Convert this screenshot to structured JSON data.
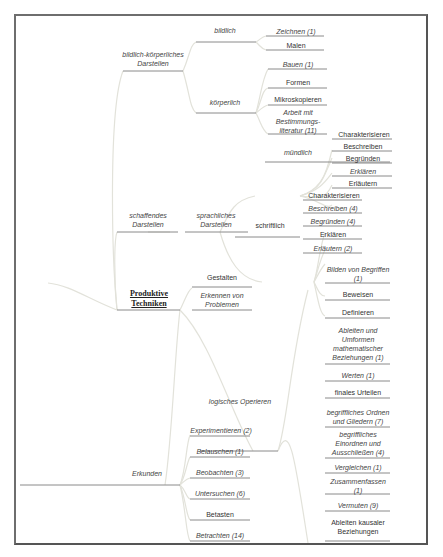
{
  "root": {
    "label": "Produktive Techniken"
  },
  "nodes": {
    "bildlich_koerperlich": "bildlich-körperliches Darstellen",
    "bildlich": "bildlich",
    "zeichnen": "Zeichnen (1)",
    "malen": "Malen",
    "koerperlich": "körperlich",
    "bauen": "Bauen (1)",
    "formen": "Formen",
    "mikroskopieren": "Mikroskopieren",
    "arbeit": "Arbeit mit Bestimmungs-literatur (11)",
    "schaffendes": "schaffendes Darstellen",
    "sprachliches": "sprachliches Darstellen",
    "muendlich": "mündlich",
    "m_charakterisieren": "Charakterisieren",
    "m_beschreiben": "Beschreiben",
    "m_begruenden": "Begründen",
    "m_erklaeren": "Erklären",
    "m_erlaeutern": "Erläutern",
    "schriftlich": "schriftlich",
    "s_charakterisieren": "Charakterisieren",
    "s_beschreiben": "Beschreiben (4)",
    "s_begruenden": "Begründen (4)",
    "s_erklaeren": "Erklären",
    "s_erlaeutern": "Erläutern (2)",
    "gestalten": "Gestalten",
    "erkennen": "Erkennen von Problemen",
    "logisches": "logisches Operieren",
    "l_bilden": "Bilden von Begriffen (1)",
    "l_beweisen": "Beweisen",
    "l_definieren": "Definieren",
    "l_ableiten": "Ableiten und Umformen mathematischer Beziehungen (1)",
    "l_werten": "Werten (1)",
    "l_finales": "finales Urteilen",
    "l_ordnen": "begriffliches Ordnen und Gliedern (7)",
    "l_einordnen": "begriffliches Einordnen und Ausschließen (4)",
    "l_vergleichen": "Vergleichen (1)",
    "l_zusammenfassen": "Zusammenfassen (1)",
    "l_vermuten": "Vermuten (9)",
    "l_kausal": "Ableiten kausaler Beziehungen",
    "erkunden": "Erkunden",
    "e_experimentieren": "Experimentieren (2)",
    "e_belauschen": "Belauschen (1)",
    "e_beobachten": "Beobachten (3)",
    "e_untersuchen": "Untersuchen (6)",
    "e_betasten": "Betasten",
    "e_betrachten": "Betrachten (14)"
  },
  "colors": {
    "branch": "#e4e4dc",
    "underline": "#8a8a8a",
    "frame": "#6e6e6e",
    "text": "#333333"
  }
}
